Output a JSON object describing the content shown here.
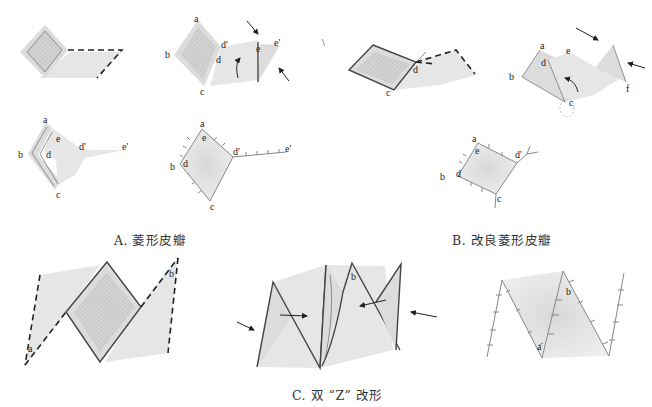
{
  "figure": {
    "panels": [
      {
        "id": "A",
        "caption": "A. 菱形皮瓣",
        "steps": [
          {
            "step": 1,
            "labels": []
          },
          {
            "step": 2,
            "labels": [
              "a",
              "b",
              "c",
              "d",
              "d'",
              "e",
              "e'"
            ]
          },
          {
            "step": 3,
            "labels": [
              "a",
              "b",
              "c",
              "d",
              "d'",
              "e",
              "e'"
            ]
          },
          {
            "step": 4,
            "labels": [
              "a",
              "b",
              "c",
              "d",
              "d'",
              "e",
              "e'"
            ]
          }
        ]
      },
      {
        "id": "B",
        "caption": "B. 改良菱形皮瓣",
        "steps": [
          {
            "step": 1,
            "labels": [
              "c",
              "d"
            ]
          },
          {
            "step": 2,
            "labels": [
              "a",
              "b",
              "c",
              "d",
              "e",
              "f"
            ]
          },
          {
            "step": 3,
            "labels": [
              "a",
              "b",
              "c",
              "d",
              "d'",
              "e"
            ]
          }
        ]
      },
      {
        "id": "C",
        "caption": "C. 双 “Z” 改形",
        "steps": [
          {
            "step": 1,
            "labels": [
              "a",
              "b"
            ]
          },
          {
            "step": 2,
            "labels": [
              "b"
            ]
          },
          {
            "step": 3,
            "labels": [
              "a",
              "b"
            ]
          }
        ]
      }
    ],
    "point_labels": {
      "a": "a",
      "b": "b",
      "c": "c",
      "d": "d",
      "d_prime": "d'",
      "e": "e",
      "e_prime": "e'",
      "f": "f"
    },
    "colors": {
      "skin_fill": "#dcdcdc",
      "defect_hatch": "#bdbdbd",
      "outline": "#444444",
      "incision_dash": "#222222",
      "suture": "#888888"
    }
  }
}
